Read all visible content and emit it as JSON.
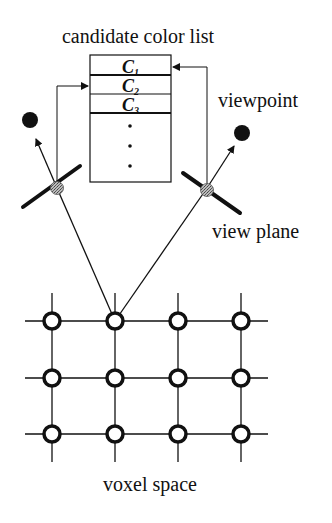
{
  "diagram": {
    "title": "candidate color list",
    "list": {
      "items": [
        {
          "letter": "C",
          "sub": "1"
        },
        {
          "letter": "C",
          "sub": "2"
        },
        {
          "letter": "C",
          "sub": "3"
        }
      ],
      "ellipsis": "⋮"
    },
    "labels": {
      "viewpoint": "viewpoint",
      "view_plane": "view plane",
      "voxel_space": "voxel space"
    },
    "grid": {
      "columns": 4,
      "rows": 3
    },
    "colors": {
      "ink": "#111111",
      "background": "#ffffff",
      "projection_point": "#9a9a9a"
    }
  }
}
